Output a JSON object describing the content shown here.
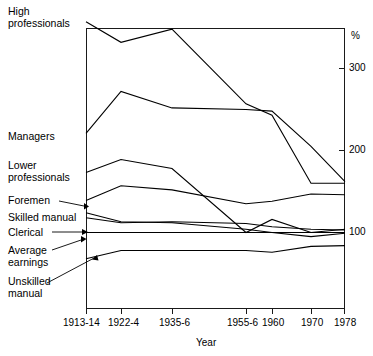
{
  "chart_data": {
    "type": "line",
    "title": "",
    "xlabel": "Year",
    "ylabel": "%",
    "yunit_label": "%",
    "categories": [
      "1913-14",
      "1922-4",
      "1935-6",
      "1955-6",
      "1960",
      "1970",
      "1978"
    ],
    "ytick_labels": [
      "300",
      "200",
      "100"
    ],
    "ytick_values": [
      300,
      200,
      100
    ],
    "ylim": [
      40,
      360
    ],
    "grid": false,
    "legend_position": "left-labels-with-leaders",
    "series": [
      {
        "name": "High professionals",
        "values": [
          357,
          332,
          348,
          257,
          243,
          160,
          160
        ]
      },
      {
        "name": "Managers",
        "values": [
          221,
          272,
          252,
          250,
          248,
          205,
          162
        ]
      },
      {
        "name": "Lower professionals",
        "values": [
          173,
          189,
          178,
          100,
          116,
          100,
          104
        ]
      },
      {
        "name": "Foremen",
        "values": [
          139,
          157,
          152,
          135,
          138,
          147,
          146
        ]
      },
      {
        "name": "Skilled manual",
        "values": [
          124,
          113,
          112,
          104,
          100,
          95,
          99
        ]
      },
      {
        "name": "Clerical",
        "values": [
          118,
          112,
          113,
          111,
          107,
          104,
          103
        ]
      },
      {
        "name": "Average earnings",
        "values": [
          100,
          100,
          100,
          100,
          100,
          100,
          100
        ]
      },
      {
        "name": "Unskilled manual",
        "values": [
          68,
          78,
          78,
          78,
          76,
          83,
          84
        ]
      }
    ]
  },
  "labels": {
    "high_professionals": "High\nprofessionals",
    "high_professionals_l1": "High",
    "high_professionals_l2": "professionals",
    "managers": "Managers",
    "lower_professionals_l1": "Lower",
    "lower_professionals_l2": "professionals",
    "foremen": "Foremen",
    "skilled_manual": "Skilled manual",
    "clerical": "Clerical",
    "average_earnings_l1": "Average",
    "average_earnings_l2": "earnings",
    "unskilled_manual_l1": "Unskilled",
    "unskilled_manual_l2": "manual"
  },
  "axes": {
    "percent_symbol": "%",
    "y_300": "300",
    "y_200": "200",
    "y_100": "100",
    "x_label": "Year",
    "x_1913": "1913-14",
    "x_1922": "1922-4",
    "x_1935": "1935-6",
    "x_1955": "1955-6",
    "x_1960": "1960",
    "x_1970": "1970",
    "x_1978": "1978"
  },
  "colors": {
    "line": "#000000",
    "axis": "#1a1a1a",
    "background": "#ffffff"
  }
}
